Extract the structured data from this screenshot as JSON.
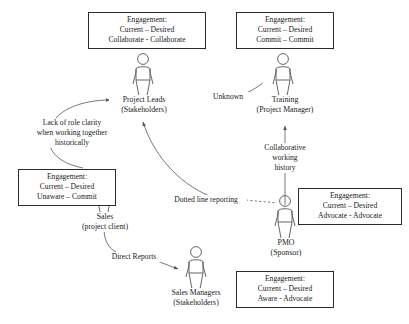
{
  "diagram": {
    "line_color": "#555555",
    "text_color": "#1a1a1a",
    "box_border_color": "#2b2b2b",
    "background": "#ffffff"
  },
  "engagement_boxes": [
    {
      "id": "project-leads",
      "heading": "Engagement:",
      "scale_line": "Current – Desired",
      "values_line": "Collaborate - Collaborate",
      "current": "Collaborate",
      "desired": "Collaborate"
    },
    {
      "id": "training",
      "heading": "Engagement:",
      "scale_line": "Current – Desired",
      "values_line": "Commit – Commit",
      "current": "Commit",
      "desired": "Commit"
    },
    {
      "id": "sales",
      "heading": "Engagement:",
      "scale_line": "Current – Desired",
      "values_line": "Unaware – Commit",
      "current": "Unaware",
      "desired": "Commit"
    },
    {
      "id": "pmo",
      "heading": "Engagement:",
      "scale_line": "Current – Desired",
      "values_line": "Advocate - Advocate",
      "current": "Advocate",
      "desired": "Advocate"
    },
    {
      "id": "sales-managers",
      "heading": "Engagement:",
      "scale_line": "Current – Desired",
      "values_line": "Aware - Advocate",
      "current": "Aware",
      "desired": "Advocate"
    }
  ],
  "nodes": [
    {
      "id": "project-leads",
      "name": "Project Leads",
      "role": "(Stakeholders)",
      "icon": "person-icon"
    },
    {
      "id": "training",
      "name": "Training",
      "role": "(Project Manager)",
      "icon": "person-icon"
    },
    {
      "id": "sales",
      "name": "Sales",
      "role": "(project client)",
      "icon": "person-icon"
    },
    {
      "id": "pmo",
      "name": "PMO",
      "role": "(Sponsor)",
      "icon": "person-icon"
    },
    {
      "id": "sales-managers",
      "name": "Sales Managers",
      "role": "(Stakeholders)",
      "icon": "person-icon"
    }
  ],
  "edges": [
    {
      "id": "project-leads-training",
      "label_lines": [
        "Unknown"
      ],
      "from": "Training",
      "to": "Project Leads",
      "style": "solid"
    },
    {
      "id": "sales-project-leads",
      "label_lines": [
        "Lack of role clarity",
        "when working together",
        "historically"
      ],
      "from": "Sales",
      "to": "Project Leads",
      "style": "solid"
    },
    {
      "id": "pmo-training",
      "label_lines": [
        "Collaborative",
        "working",
        "history"
      ],
      "from": "PMO",
      "to": "Training",
      "style": "solid"
    },
    {
      "id": "pmo-project-leads",
      "label_lines": [
        "Dotted line reporting"
      ],
      "from": "PMO",
      "to": "Project Leads",
      "style": "dashed"
    },
    {
      "id": "sales-sales-managers",
      "label_lines": [
        "Direct Reports"
      ],
      "from": "Sales",
      "to": "Sales Managers",
      "style": "solid"
    }
  ]
}
